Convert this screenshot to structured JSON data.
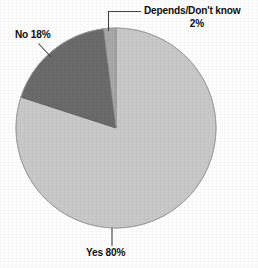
{
  "chart_data": {
    "type": "pie",
    "title": "",
    "subtitle": "",
    "xlabel": "",
    "ylabel": "",
    "legend_position": "none",
    "grid": false,
    "categories": [
      "Yes",
      "No",
      "Depends/Don't know"
    ],
    "values": [
      80,
      18,
      2
    ],
    "units": "percent",
    "start_angle_deg": 0,
    "direction": "clockwise",
    "slices": [
      {
        "name": "Yes",
        "label": "Yes 80%",
        "label_text": "Yes",
        "value": 80,
        "value_label": "80%",
        "color": "#c8c8c8",
        "start_deg": 0,
        "end_deg": 288,
        "leader": "vertical-down"
      },
      {
        "name": "No",
        "label": "No 18%",
        "label_text": "No",
        "value": 18,
        "value_label": "18%",
        "color": "#6b6b6b",
        "start_deg": 288,
        "end_deg": 352.8,
        "leader": "diagonal-up-left"
      },
      {
        "name": "Depends/Don't know",
        "label": "Depends/Don't know 2%",
        "label_text": "Depends/Don't know",
        "value": 2,
        "value_label": "2%",
        "color": "#a8a8a8",
        "start_deg": 352.8,
        "end_deg": 360,
        "leader": "elbow-up-right"
      }
    ]
  },
  "labels": {
    "depends": "Depends/Don't know",
    "depends_value": "2%",
    "no": "No 18%",
    "yes": "Yes 80%"
  },
  "colors": {
    "background": "#fdfdfd",
    "yes_slice": "#c8c8c8",
    "no_slice": "#6b6b6b",
    "depends_slice": "#a8a8a8",
    "outline": "#8a8a8a",
    "leader_line": "#555555",
    "text": "#101010"
  }
}
